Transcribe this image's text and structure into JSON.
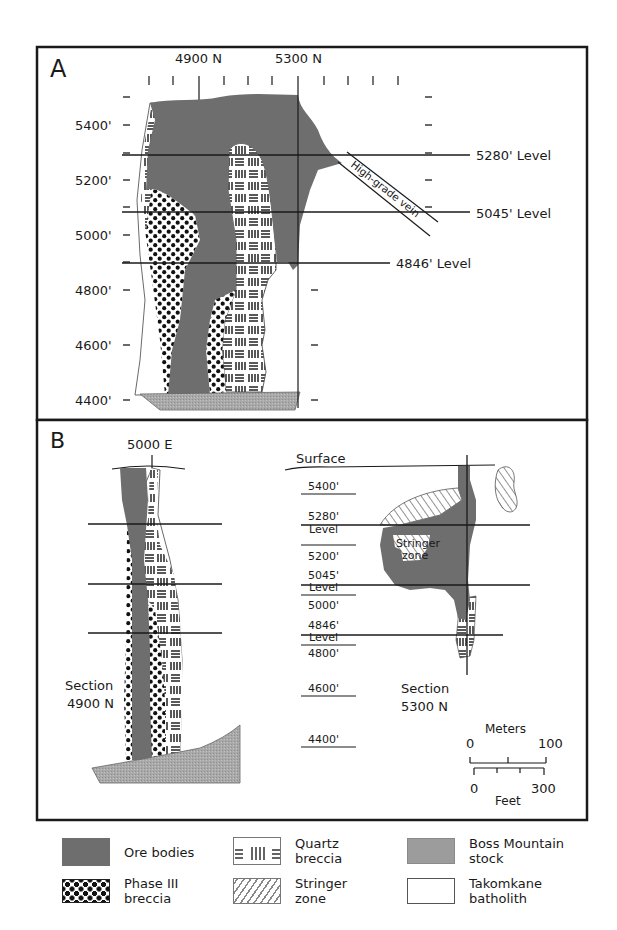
{
  "figure": {
    "panels": [
      {
        "id": "A",
        "label": "A",
        "northing_labels": [
          "4900 N",
          "5300 N"
        ],
        "elevation_labels": [
          "5400'",
          "5200'",
          "5000'",
          "4800'",
          "4600'",
          "4400'"
        ],
        "level_labels": [
          "5280' Level",
          "5045' Level",
          "4846' Level"
        ],
        "vein_label": "High-grade vein"
      },
      {
        "id": "B",
        "label": "B",
        "easting_label": "5000 E",
        "surface_label": "Surface",
        "elevation_labels": [
          "5400'",
          "5280'",
          "Level",
          "5200'",
          "5045'",
          "Level",
          "5000'",
          "4846'",
          "Level",
          "4800'",
          "4600'",
          "4400'"
        ],
        "section_left": [
          "Section",
          "4900 N"
        ],
        "section_right": [
          "Section",
          "5300 N"
        ],
        "stringer_label": [
          "Stringer",
          "zone"
        ],
        "scale": {
          "meters_title": "Meters",
          "meters_min": "0",
          "meters_max": "100",
          "feet_min": "0",
          "feet_max": "300",
          "feet_title": "Feet"
        }
      }
    ],
    "colors": {
      "ore": "#6e6e6e",
      "stock": "#a9a9a9",
      "line": "#1a1a1a"
    }
  },
  "legend": {
    "items": [
      {
        "key": "ore",
        "line1": "Ore bodies",
        "line2": ""
      },
      {
        "key": "phase",
        "line1": "Phase III",
        "line2": "breccia"
      },
      {
        "key": "quartz",
        "line1": "Quartz",
        "line2": "breccia"
      },
      {
        "key": "stringer",
        "line1": "Stringer",
        "line2": "zone"
      },
      {
        "key": "stock",
        "line1": "Boss Mountain",
        "line2": "stock"
      },
      {
        "key": "batholith",
        "line1": "Takomkane",
        "line2": "batholith"
      }
    ]
  }
}
